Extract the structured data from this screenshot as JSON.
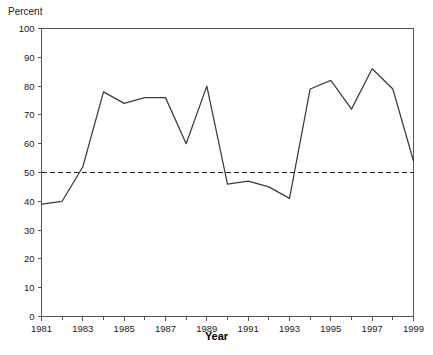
{
  "chart_data": {
    "type": "line",
    "title": "",
    "subtitle": "",
    "xlabel": "Year",
    "ylabel": "Percent",
    "x": [
      1981,
      1982,
      1983,
      1984,
      1985,
      1986,
      1987,
      1988,
      1989,
      1990,
      1991,
      1992,
      1993,
      1994,
      1995,
      1996,
      1997,
      1998,
      1999
    ],
    "series": [
      {
        "name": "Percent",
        "values": [
          39,
          40,
          52,
          78,
          74,
          76,
          76,
          60,
          80,
          46,
          47,
          45,
          41,
          79,
          82,
          72,
          86,
          79,
          54
        ],
        "color": "#3c3c3c"
      }
    ],
    "xlim": [
      1981,
      1999
    ],
    "ylim": [
      0,
      100
    ],
    "ytick_values": [
      0,
      10,
      20,
      30,
      40,
      50,
      60,
      70,
      80,
      90,
      100
    ],
    "ytick_labels": [
      "0",
      "10",
      "20",
      "30",
      "40",
      "50",
      "60",
      "70",
      "80",
      "90",
      "100"
    ],
    "xtick_values": [
      1981,
      1983,
      1985,
      1987,
      1989,
      1991,
      1993,
      1995,
      1997,
      1999
    ],
    "xtick_labels": [
      "1981",
      "1983",
      "1985",
      "1987",
      "1989",
      "1991",
      "1993",
      "1995",
      "1997",
      "1999"
    ],
    "xtick_minor_values": [
      1982,
      1984,
      1986,
      1988,
      1990,
      1992,
      1994,
      1996,
      1998
    ],
    "grid": false,
    "legend": "none",
    "annotations": [
      {
        "type": "hline",
        "name": "fifty-percent-reference-line",
        "value": 50,
        "style": "dashed",
        "color": "#222222"
      }
    ]
  },
  "axis_title_color": "#000000",
  "axis_line_color": "#555555"
}
